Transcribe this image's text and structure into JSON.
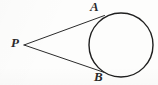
{
  "figure": {
    "kind": "geometry-diagram",
    "background_color": "#fdfdfc",
    "stroke_color": "#1f1f1f",
    "label_color": "#2a2a2a",
    "labels": {
      "vertex": "P",
      "upper_tangency": "A",
      "lower_tangency": "B"
    },
    "circle": {
      "center_x": 121,
      "center_y": 45,
      "radius": 32,
      "stroke_width": 1.4
    },
    "external_point": {
      "x": 24,
      "y": 45
    },
    "tangent_points": {
      "A": {
        "x": 104.5,
        "y": 15.5
      },
      "B": {
        "x": 104.5,
        "y": 72.5
      }
    },
    "tangent_lines": [
      {
        "name": "PA",
        "x1": 24,
        "y1": 45,
        "x2": 104.5,
        "y2": 15.5,
        "stroke_width": 1.0
      },
      {
        "name": "PB",
        "x1": 24,
        "y1": 45,
        "x2": 104.5,
        "y2": 72.5,
        "stroke_width": 1.0
      }
    ]
  }
}
